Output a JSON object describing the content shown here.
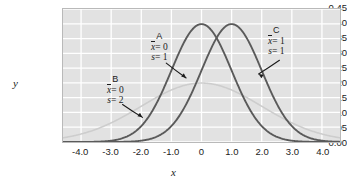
{
  "chart_data": {
    "type": "line",
    "title": "",
    "xlabel": "x",
    "ylabel": "y",
    "xlim": [
      -4.6,
      4.6
    ],
    "ylim": [
      0.0,
      0.45
    ],
    "grid": true,
    "legend_position": "inline-annotations",
    "xticks": [
      "-4.0",
      "-3.0",
      "-2.0",
      "-1.0",
      "0",
      "1.0",
      "2.0",
      "3.0",
      "4.0"
    ],
    "xtick_values": [
      -4,
      -3,
      -2,
      -1,
      0,
      1,
      2,
      3,
      4
    ],
    "yticks": [
      "0.00",
      "0.05",
      "0.10",
      "0.15",
      "0.20",
      "0.25",
      "0.30",
      "0.35",
      "0.40",
      "0.45"
    ],
    "ytick_values": [
      0.0,
      0.05,
      0.1,
      0.15,
      0.2,
      0.25,
      0.3,
      0.35,
      0.4,
      0.45
    ],
    "series": [
      {
        "name": "A",
        "mean": 0,
        "sd": 1,
        "peak_value": 0.399,
        "peak_x": 0,
        "color": "#5a5a5a",
        "label_title": "A",
        "label_mean": "= 0",
        "label_sd": "= 1"
      },
      {
        "name": "B",
        "mean": 0,
        "sd": 2,
        "peak_value": 0.199,
        "peak_x": 0,
        "color": "#cdcdcd",
        "label_title": "B",
        "label_mean": "= 0",
        "label_sd": "= 2"
      },
      {
        "name": "C",
        "mean": 1,
        "sd": 1,
        "peak_value": 0.399,
        "peak_x": 1,
        "color": "#5a5a5a",
        "label_title": "C",
        "label_mean": "= 1",
        "label_sd": "= 1"
      }
    ]
  },
  "annotations": {
    "a": {
      "title": "A",
      "mean_sym": "x",
      "mean_eq": "= 0",
      "sd_sym": "s",
      "sd_eq": "= 1"
    },
    "b": {
      "title": "B",
      "mean_sym": "x",
      "mean_eq": "= 0",
      "sd_sym": "s",
      "sd_eq": "= 2"
    },
    "c": {
      "title": "C",
      "mean_sym": "x",
      "mean_eq": "= 1",
      "sd_sym": "s",
      "sd_eq": "= 1"
    }
  },
  "axes": {
    "x_title": "x",
    "y_title": "y"
  }
}
